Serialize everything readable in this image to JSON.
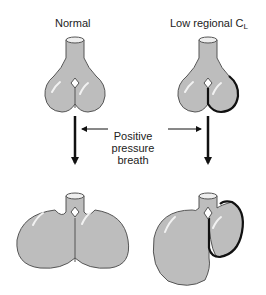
{
  "labels": {
    "normal": "Normal",
    "low_regional_prefix": "Low regional C",
    "low_regional_subscript": "L",
    "positive_pressure_breath": [
      "Positive",
      "pressure",
      "breath"
    ]
  },
  "colors": {
    "lung_fill": "#bdbdbd",
    "outline": "#555555",
    "stiff_outline": "#111111",
    "highlight": "#f2f2f2"
  },
  "panels": [
    {
      "name": "normal-before",
      "state": "before breath",
      "compliance": "normal"
    },
    {
      "name": "low-cl-before",
      "state": "before breath",
      "compliance": "low regional"
    },
    {
      "name": "normal-after",
      "state": "after positive pressure breath",
      "compliance": "normal"
    },
    {
      "name": "low-cl-after",
      "state": "after positive pressure breath",
      "compliance": "low regional"
    }
  ]
}
